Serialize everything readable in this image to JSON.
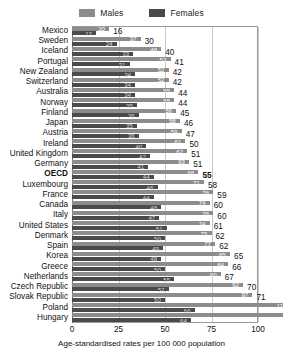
{
  "legend": {
    "items": [
      {
        "label": "Males",
        "color": "#8c8c8c",
        "icon": "legend-swatch-males"
      },
      {
        "label": "Females",
        "color": "#4a4a4a",
        "icon": "legend-swatch-females"
      }
    ]
  },
  "axis": {
    "ticks": [
      "0",
      "25",
      "50",
      "75",
      "100"
    ],
    "title": "Age-standardised rates per 100 000 population"
  },
  "chart_data": {
    "type": "bar",
    "orientation": "horizontal",
    "title": "",
    "subtitle": "",
    "xlabel": "Age-standardised rates per 100 000 population",
    "ylabel": "",
    "xlim": [
      0,
      100
    ],
    "xticks": [
      0,
      25,
      50,
      75,
      100
    ],
    "grid": true,
    "legend_position": "top-center",
    "categories": [
      "Mexico",
      "Sweden",
      "Iceland",
      "Portugal",
      "New Zealand",
      "Switzerland",
      "Australia",
      "Norway",
      "Finland",
      "Japan",
      "Austria",
      "Ireland",
      "United Kingdom",
      "Germany",
      "OECD",
      "Luxembourg",
      "France",
      "Canada",
      "Italy",
      "United States",
      "Denmark",
      "Spain",
      "Korea",
      "Greece",
      "Netherlands",
      "Czech Republic",
      "Slovak Republic",
      "Poland",
      "Hungary"
    ],
    "highlight_category": "OECD",
    "series": [
      {
        "name": "Males",
        "color": "#8c8c8c",
        "values": [
          20,
          37,
          48,
          53,
          52,
          52,
          55,
          55,
          56,
          58,
          59,
          61,
          62,
          63,
          68,
          71,
          76,
          74,
          76,
          74,
          75,
          77,
          85,
          84,
          80,
          92,
          97,
          116,
          128
        ]
      },
      {
        "name": "Females",
        "color": "#4a4a4a",
        "values": [
          13,
          24,
          33,
          31,
          34,
          34,
          34,
          35,
          36,
          35,
          36,
          40,
          42,
          41,
          44,
          46,
          44,
          48,
          47,
          51,
          50,
          49,
          48,
          50,
          55,
          52,
          50,
          66,
          64
        ]
      }
    ],
    "total_labels": [
      16,
      30,
      40,
      41,
      42,
      42,
      44,
      44,
      45,
      46,
      47,
      50,
      51,
      51,
      55,
      58,
      59,
      60,
      60,
      61,
      62,
      62,
      65,
      66,
      67,
      70,
      71,
      89,
      94
    ],
    "note": "Total label shown at right of each pair is the combined/overall age-standardised rate"
  }
}
